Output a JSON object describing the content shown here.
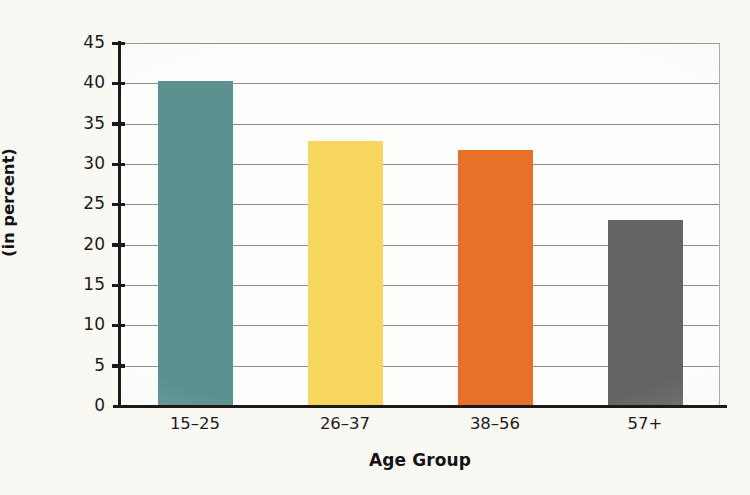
{
  "chart_data": {
    "type": "bar",
    "title": "",
    "xlabel": "Age Group",
    "ylabel_line1": "Rate of Volunteer Activity",
    "ylabel_line2": "(in percent)",
    "ylabel": "Rate of Volunteer Activity (in percent)",
    "categories": [
      "15–25",
      "26–37",
      "38–56",
      "57+"
    ],
    "values": [
      40.3,
      32.8,
      31.7,
      23.0
    ],
    "ylim": [
      0,
      45
    ],
    "ytick_values": [
      0,
      5,
      10,
      15,
      20,
      25,
      30,
      35,
      40,
      45
    ],
    "ytick_labels": [
      "0",
      "5",
      "10",
      "15",
      "20",
      "25",
      "30",
      "35",
      "40",
      "45"
    ],
    "bar_colors": [
      "#5b918f",
      "#f7d65d",
      "#e8712a",
      "#646463"
    ],
    "grid": true,
    "grid_axis": "y",
    "legend": false,
    "legend_position": "none",
    "background_color": "#faf8f2",
    "plot_background_color": "#fdfdfb",
    "axis_color": "#1a1a1a",
    "grid_color": "#8d8d8a"
  }
}
